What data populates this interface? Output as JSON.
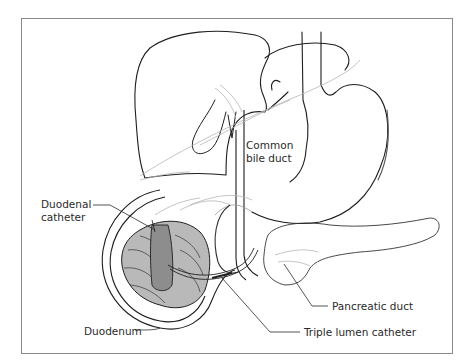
{
  "diagram": {
    "labels": {
      "common_bile_duct": [
        "Common",
        "bile duct"
      ],
      "duodenal_catheter": [
        "Duodenal",
        "catheter"
      ],
      "pancreatic_duct": "Pancreatic duct",
      "duodenum": "Duodenum",
      "triple_lumen_catheter": "Triple lumen catheter"
    },
    "colors": {
      "frame": "#8a8a8a",
      "outline": "#1e1e1e",
      "light_line": "#b5b5b5",
      "duodenum_fill": "#b9b9b9",
      "catheter_fill": "#8d8d8d"
    }
  }
}
